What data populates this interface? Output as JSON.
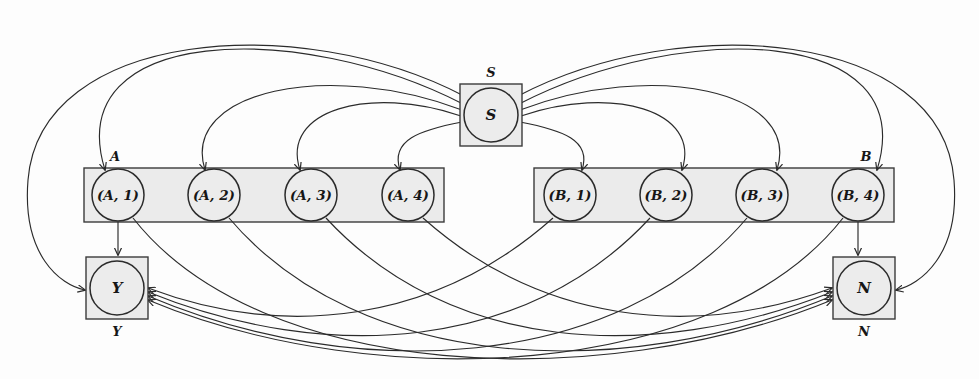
{
  "figure": {
    "kind": "directed-graph-diagram",
    "background": "#fdfdfd",
    "ink": "#2b2b2b",
    "group_fill": "#ebebeb",
    "node_fill": "#ececec"
  },
  "groups": [
    {
      "id": "A",
      "label": "A",
      "label_pos": "top-left",
      "x": 84,
      "y": 168,
      "w": 360,
      "h": 54
    },
    {
      "id": "B",
      "label": "B",
      "label_pos": "top-right",
      "x": 534,
      "y": 168,
      "w": 360,
      "h": 54
    }
  ],
  "nodes": {
    "s": {
      "id": "S",
      "label": "S",
      "outer_label": "S",
      "outer_label_pos": "above",
      "cx": 491,
      "cy": 115,
      "r": 27,
      "box": 31,
      "shape": "boxed-circle"
    },
    "y": {
      "id": "Y",
      "label": "Y",
      "outer_label": "Y",
      "outer_label_pos": "below",
      "cx": 117,
      "cy": 288,
      "r": 27,
      "box": 31,
      "shape": "boxed-circle"
    },
    "n": {
      "id": "N",
      "label": "N",
      "outer_label": "N",
      "outer_label_pos": "below",
      "cx": 864,
      "cy": 288,
      "r": 27,
      "box": 31,
      "shape": "boxed-circle"
    },
    "a": [
      {
        "id": "A1",
        "label": "(A, 1)",
        "cx": 118,
        "cy": 195,
        "r": 26
      },
      {
        "id": "A2",
        "label": "(A, 2)",
        "cx": 214,
        "cy": 195,
        "r": 26
      },
      {
        "id": "A3",
        "label": "(A, 3)",
        "cx": 311,
        "cy": 195,
        "r": 26
      },
      {
        "id": "A4",
        "label": "(A, 4)",
        "cx": 408,
        "cy": 195,
        "r": 26
      }
    ],
    "b": [
      {
        "id": "B1",
        "label": "(B, 1)",
        "cx": 570,
        "cy": 195,
        "r": 26
      },
      {
        "id": "B2",
        "label": "(B, 2)",
        "cx": 666,
        "cy": 195,
        "r": 26
      },
      {
        "id": "B3",
        "label": "(B, 3)",
        "cx": 762,
        "cy": 195,
        "r": 26
      },
      {
        "id": "B4",
        "label": "(B, 4)",
        "cx": 858,
        "cy": 195,
        "r": 26
      }
    ]
  },
  "edges": {
    "s_to_a": [
      "S→(A, 1)",
      "S→(A, 2)",
      "S→(A, 3)",
      "S→(A, 4)"
    ],
    "s_to_b": [
      "S→(B, 1)",
      "S→(B, 2)",
      "S→(B, 3)",
      "S→(B, 4)"
    ],
    "s_to_y": "S→Y",
    "s_to_n": "S→N",
    "a_to_y": [
      "(A, 1)→Y"
    ],
    "b_to_n": [
      "(B, 4)→N"
    ],
    "a_to_n": [
      "(A, 1)→N",
      "(A, 2)→N",
      "(A, 3)→N",
      "(A, 4)→N"
    ],
    "b_to_y": [
      "(B, 1)→Y",
      "(B, 2)→Y",
      "(B, 3)→Y",
      "(B, 4)→Y"
    ],
    "arrowhead": "open-v",
    "style": "curved"
  },
  "labels": {
    "group_a": "A",
    "group_b": "B",
    "s_outer": "S",
    "s_inner": "S",
    "y_outer": "Y",
    "y_inner": "Y",
    "n_outer": "N",
    "n_inner": "N",
    "a1": "(A, 1)",
    "a2": "(A, 2)",
    "a3": "(A, 3)",
    "a4": "(A, 4)",
    "b1": "(B, 1)",
    "b2": "(B, 2)",
    "b3": "(B, 3)",
    "b4": "(B, 4)"
  }
}
